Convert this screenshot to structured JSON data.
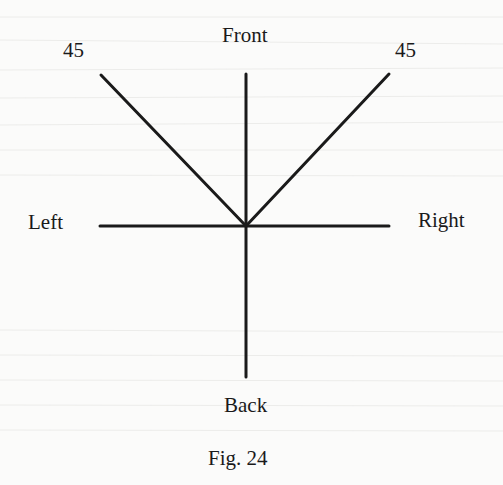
{
  "figure": {
    "caption": "Fig. 24",
    "labels": {
      "front": "Front",
      "back": "Back",
      "left": "Left",
      "right": "Right",
      "angle_left": "45",
      "angle_right": "45"
    },
    "center": [
      246,
      226
    ],
    "lines": [
      {
        "name": "front-axis",
        "from": [
          246,
          226
        ],
        "to": [
          246,
          74
        ]
      },
      {
        "name": "back-axis",
        "from": [
          246,
          226
        ],
        "to": [
          246,
          377
        ]
      },
      {
        "name": "left-axis",
        "from": [
          246,
          226
        ],
        "to": [
          100,
          226
        ]
      },
      {
        "name": "right-axis",
        "from": [
          246,
          226
        ],
        "to": [
          389,
          226
        ]
      },
      {
        "name": "diagonal-left-45",
        "from": [
          246,
          226
        ],
        "to": [
          101,
          75
        ]
      },
      {
        "name": "diagonal-right-45",
        "from": [
          246,
          226
        ],
        "to": [
          389,
          74
        ]
      }
    ],
    "colors": {
      "ink": "#1a1a1a",
      "paper": "#fbfbfa",
      "bleed": "#e6e6e4"
    }
  }
}
